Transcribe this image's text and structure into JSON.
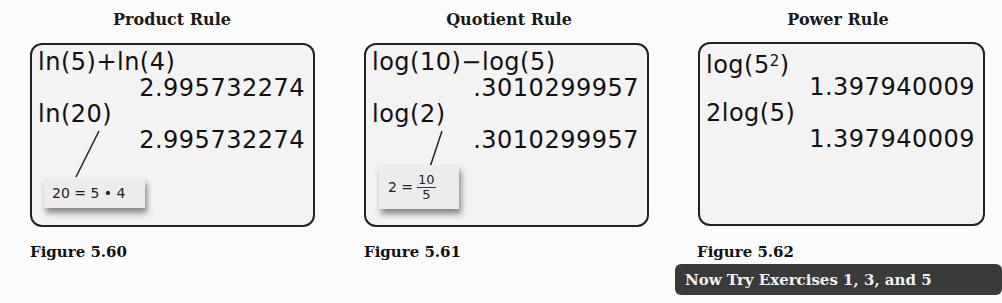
{
  "panels": [
    {
      "title": "Product Rule",
      "screen_lines": [
        {
          "text": "ln(5)+ln(4)",
          "align": "left"
        },
        {
          "text": "2.995732274",
          "align": "right"
        },
        {
          "text": "ln(20)",
          "align": "left"
        },
        {
          "text": "2.995732274",
          "align": "right"
        }
      ],
      "callout": {
        "text": "20 = 5 • 4"
      },
      "figure_label": "Figure 5.60"
    },
    {
      "title": "Quotient Rule",
      "screen_lines": [
        {
          "text": "log(10)−log(5)",
          "align": "left"
        },
        {
          "text": ".3010299957",
          "align": "right"
        },
        {
          "text": "log(2)",
          "align": "left"
        },
        {
          "text": ".3010299957",
          "align": "right"
        }
      ],
      "callout": {
        "lhs": "2 =",
        "numerator": "10",
        "denominator": "5"
      },
      "figure_label": "Figure 5.61"
    },
    {
      "title": "Power Rule",
      "screen_lines": [
        {
          "text": "log(5",
          "sup": "2",
          "tail": ")",
          "align": "left"
        },
        {
          "text": "1.397940009",
          "align": "right"
        },
        {
          "text": "2log(5)",
          "align": "left"
        },
        {
          "text": "1.397940009",
          "align": "right"
        }
      ],
      "figure_label": "Figure 5.62"
    }
  ],
  "banner": {
    "text": "Now Try Exercises 1, 3, and 5",
    "color": "#3a3a3a"
  }
}
